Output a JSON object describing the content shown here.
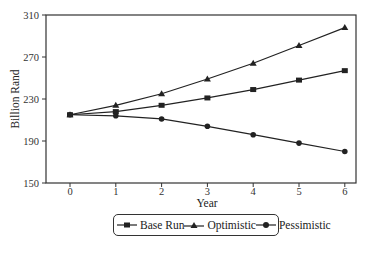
{
  "chart_data": {
    "type": "line",
    "title": "",
    "xlabel": "Year",
    "ylabel": "Billion Rand",
    "x": [
      0,
      1,
      2,
      3,
      4,
      5,
      6
    ],
    "ylim": [
      150,
      310
    ],
    "yticks": [
      150,
      190,
      230,
      270,
      310
    ],
    "xticks": [
      0,
      1,
      2,
      3,
      4,
      5,
      6
    ],
    "grid": false,
    "legend_position": "bottom",
    "series": [
      {
        "name": "Base Run",
        "marker": "square",
        "values": [
          215,
          218,
          224,
          231,
          239,
          248,
          257
        ]
      },
      {
        "name": "Optimistic",
        "marker": "triangle",
        "values": [
          215,
          224,
          235,
          249,
          264,
          281,
          298
        ]
      },
      {
        "name": "Pessimistic",
        "marker": "circle",
        "values": [
          215,
          214,
          211,
          204,
          196,
          188,
          180
        ]
      }
    ]
  },
  "axes": {
    "ylabel": "Billion Rand",
    "xlabel": "Year",
    "yticks": [
      "150",
      "190",
      "230",
      "270",
      "310"
    ],
    "xticks": [
      "0",
      "1",
      "2",
      "3",
      "4",
      "5",
      "6"
    ]
  },
  "legend": {
    "items": [
      {
        "label": "Base Run"
      },
      {
        "label": "Optimistic"
      },
      {
        "label": "Pessimistic"
      }
    ]
  }
}
